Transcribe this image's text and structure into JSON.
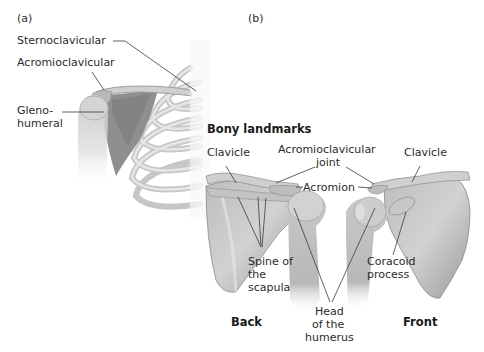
{
  "panels": {
    "a": {
      "tag": "(a)",
      "labels": {
        "sternoclavicular": "Sternoclavicular",
        "acromioclavicular": "Acromioclavicular",
        "gleno_line1": "Gleno-",
        "gleno_line2": "humeral"
      }
    },
    "b": {
      "tag": "(b)",
      "heading": "Bony landmarks",
      "labels": {
        "clavicle_left": "Clavicle",
        "ac_joint_line1": "Acromioclavicular",
        "ac_joint_line2": "joint",
        "clavicle_right": "Clavicle",
        "acromion": "Acromion",
        "spine_line1": "Spine of",
        "spine_line2": "the",
        "spine_line3": "scapula",
        "coracoid_line1": "Coracoid",
        "coracoid_line2": "process",
        "head_line1": "Head",
        "head_line2": "of the",
        "head_line3": "humerus"
      },
      "views": {
        "back": "Back",
        "front": "Front"
      }
    }
  },
  "colors": {
    "bone": "#d6d6d6",
    "bone_shadow": "#a9a9a9",
    "bone_dark": "#8c8c8c",
    "leader_line": "#3a3a3a",
    "text": "#2b2b2b"
  }
}
